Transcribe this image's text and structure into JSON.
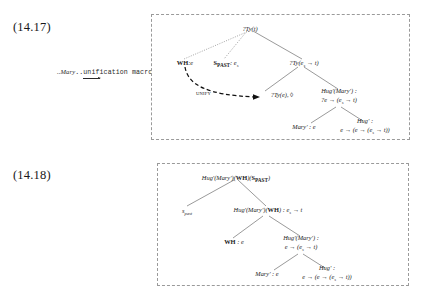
{
  "figures": [
    {
      "number": "(14.17)",
      "caption": {
        "prefix": "...",
        "italic_word": "Mary",
        "text": "...unification macro...",
        "full": "...Mary...unification macro..."
      },
      "annotation": "UNIFY",
      "nodes": {
        "root": "?Ty(t)",
        "wh": "WH:e",
        "wh_bold": "WH",
        "wh_rest": ":e",
        "s_past_bold": "S",
        "s_past_sub": "PAST",
        "s_past_rest": ": e",
        "s_past_rest_sub": "s",
        "right": "?Ty(e",
        "right_sub": "s",
        "right_rest": " → t)",
        "unify_target": "?Ty(e), ◊",
        "hug_mary_line1": "Hug'(Mary') :",
        "hug_mary_line2": "?e → (e",
        "hug_mary_line2_sub": "s",
        "hug_mary_line2_rest": " → t)",
        "mary_leaf": "Mary' : e",
        "hug_leaf_line1": "Hug' :",
        "hug_leaf_line2": "e → (e → (e",
        "hug_leaf_line2_sub": "s",
        "hug_leaf_line2_rest": " → t))"
      }
    },
    {
      "number": "(14.18)",
      "caption": {
        "full": "...tree-completion macros..."
      },
      "nodes": {
        "root_a": "Hug'(Mary')(",
        "root_wh": "WH",
        "root_b": ")(",
        "root_s": "S",
        "root_s_sub": "PAST",
        "root_c": ")",
        "s_past_leaf": "s",
        "s_past_leaf_sub": "past",
        "mid_a": "Hug'(Mary')(",
        "mid_wh": "WH",
        "mid_b": ") : e",
        "mid_sub": "s",
        "mid_c": " → t",
        "wh_bold": "WH",
        "wh_rest": " : e",
        "hug_mary_line1": "Hug'(Mary') :",
        "hug_mary_line2": "e → (e",
        "hug_mary_line2_sub": "s",
        "hug_mary_line2_rest": " → t)",
        "mary_leaf": "Mary' : e",
        "hug_leaf_line1": "Hug' :",
        "hug_leaf_line2": "e → (e → (e",
        "hug_leaf_line2_sub": "s",
        "hug_leaf_line2_rest": " → t))"
      }
    }
  ],
  "style": {
    "box_border_color": "#9a9a9a",
    "text_color": "#1c1c1c",
    "background": "#ffffff"
  }
}
